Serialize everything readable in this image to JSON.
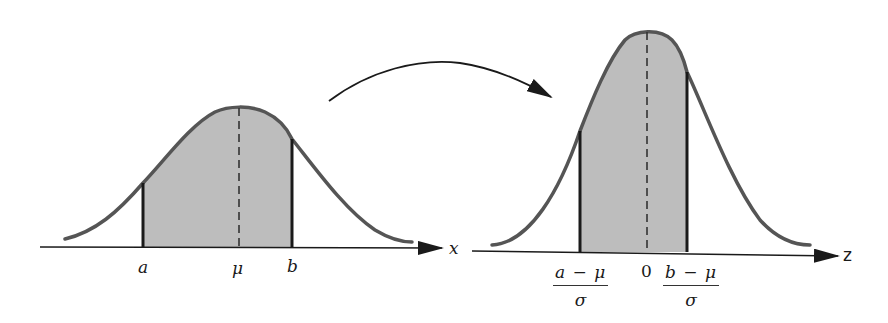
{
  "figure": {
    "colors": {
      "curve": "#555555",
      "shade": "#bdbdbd",
      "axis": "#1a1a1a",
      "text": "#1a1a1a"
    },
    "left_panel": {
      "axis_label": "x",
      "tick_labels": {
        "a": "a",
        "mu": "μ",
        "b": "b"
      }
    },
    "right_panel": {
      "axis_label": "z",
      "tick_labels": {
        "zero": "0",
        "left_fraction": {
          "numerator": "a − μ",
          "denominator": "σ"
        },
        "right_fraction": {
          "numerator": "b − μ",
          "denominator": "σ"
        }
      }
    },
    "transform_arrow": "curved-arrow-left-to-right"
  }
}
